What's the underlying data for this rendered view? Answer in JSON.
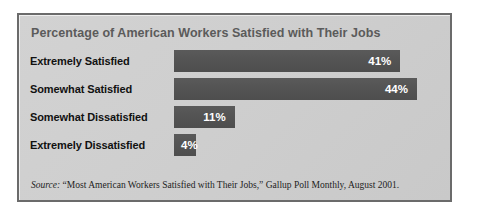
{
  "chart_data": {
    "type": "bar",
    "orientation": "horizontal",
    "title": "Percentage of American Workers Satisfied with Their Jobs",
    "xlabel": "",
    "ylabel": "",
    "grid": false,
    "legend": "none",
    "xlim": [
      0,
      48
    ],
    "categories": [
      "Extremely Satisfied",
      "Somewhat Satisfied",
      "Somewhat Dissatisfied",
      "Extremely Dissatisfied"
    ],
    "values": [
      41,
      44,
      11,
      4
    ],
    "value_labels": [
      "41%",
      "44%",
      "11%",
      "4%"
    ],
    "bars": [
      {
        "category": "Extremely Satisfied",
        "value": 41,
        "label": "41%",
        "label_position": "inside-end"
      },
      {
        "category": "Somewhat Satisfied",
        "value": 44,
        "label": "44%",
        "label_position": "inside-end"
      },
      {
        "category": "Somewhat Dissatisfied",
        "value": 11,
        "label": "11%",
        "label_position": "inside-end"
      },
      {
        "category": "Extremely Dissatisfied",
        "value": 4,
        "label": "4%",
        "label_position": "inside-start"
      }
    ],
    "bar_color": "#535353",
    "title_color": "#5b5b5b",
    "label_color": "#111111",
    "value_color": "#ffffff",
    "panel_color": "#cfcfcf",
    "border_color": "#6b6b6b"
  },
  "source": {
    "label": "Source:",
    "text": " “Most American Workers Satisfied with Their Jobs,” Gallup Poll Monthly, August 2001."
  }
}
